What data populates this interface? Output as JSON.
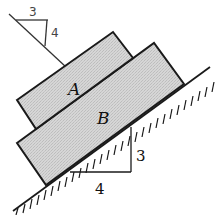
{
  "diagram": {
    "type": "physics-free-body",
    "blocks": [
      {
        "id": "A",
        "label": "A",
        "position": "top"
      },
      {
        "id": "B",
        "label": "B",
        "position": "bottom, on incline"
      }
    ],
    "incline": {
      "rise_label": "3",
      "run_label": "4"
    },
    "sketch_annotation": {
      "horizontal_label": "3",
      "vertical_label": "4"
    },
    "colors": {
      "ink": "#1a1a1a",
      "block_fill": "#d4d4d4",
      "background": "#ffffff"
    }
  }
}
